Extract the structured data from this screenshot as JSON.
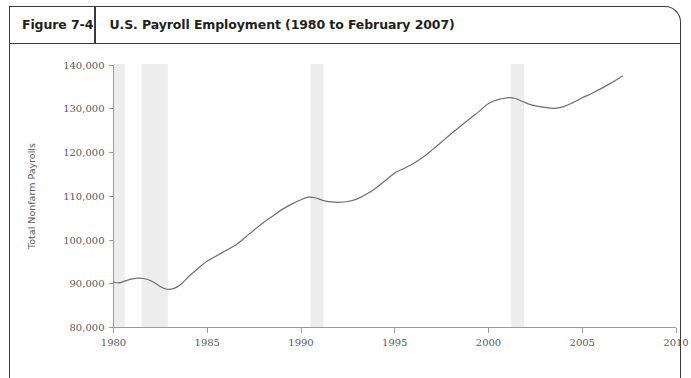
{
  "figure": {
    "number_label": "Figure 7-4",
    "title": "U.S. Payroll Employment (1980 to February 2007)"
  },
  "chart_data": {
    "type": "line",
    "title": "U.S. Payroll Employment (1980 to February 2007)",
    "xlabel": "",
    "ylabel": "Total Nonfarm Payrolls",
    "xlim": [
      1980,
      2010
    ],
    "ylim": [
      80000,
      140000
    ],
    "grid": false,
    "legend": false,
    "x_ticks": [
      "1980",
      "1985",
      "1990",
      "1995",
      "2000",
      "2005",
      "2010"
    ],
    "y_ticks": [
      "80,000",
      "90,000",
      "100,000",
      "110,000",
      "120,000",
      "130,000",
      "140,000"
    ],
    "line_color": "#6d6e71",
    "band_color": "#ededed",
    "annotations": [
      {
        "name": "recession-band-1980",
        "x_start": 1980.0,
        "x_end": 1980.6
      },
      {
        "name": "recession-band-1981-1982",
        "x_start": 1981.5,
        "x_end": 1982.9
      },
      {
        "name": "recession-band-1990-1991",
        "x_start": 1990.5,
        "x_end": 1991.2
      },
      {
        "name": "recession-band-2001",
        "x_start": 2001.2,
        "x_end": 2001.9
      }
    ],
    "series": [
      {
        "name": "Total Nonfarm Payrolls",
        "x": [
          1980.0,
          1980.3,
          1980.6,
          1981.0,
          1981.3,
          1981.6,
          1982.0,
          1982.4,
          1982.8,
          1983.2,
          1983.6,
          1984.0,
          1984.5,
          1985.0,
          1985.5,
          1986.0,
          1986.5,
          1987.0,
          1987.5,
          1988.0,
          1988.5,
          1989.0,
          1989.5,
          1990.0,
          1990.4,
          1990.8,
          1991.2,
          1991.6,
          1992.0,
          1992.5,
          1993.0,
          1993.5,
          1994.0,
          1994.5,
          1995.0,
          1995.5,
          1996.0,
          1996.5,
          1997.0,
          1997.5,
          1998.0,
          1998.5,
          1999.0,
          1999.5,
          2000.0,
          2000.5,
          2001.0,
          2001.4,
          2001.8,
          2002.2,
          2002.6,
          2003.0,
          2003.5,
          2004.0,
          2004.5,
          2005.0,
          2005.5,
          2006.0,
          2006.5,
          2007.15
        ],
        "values": [
          90400,
          90200,
          90600,
          91100,
          91300,
          91200,
          90700,
          89600,
          88800,
          88900,
          89900,
          91600,
          93500,
          95200,
          96400,
          97600,
          98800,
          100500,
          102300,
          104000,
          105500,
          107000,
          108200,
          109200,
          109800,
          109600,
          109000,
          108700,
          108600,
          108800,
          109400,
          110500,
          111900,
          113600,
          115300,
          116400,
          117500,
          118900,
          120600,
          122400,
          124300,
          126000,
          127700,
          129400,
          131200,
          132100,
          132500,
          132400,
          131700,
          131000,
          130600,
          130300,
          130100,
          130500,
          131400,
          132500,
          133500,
          134600,
          135800,
          137500
        ]
      }
    ]
  }
}
